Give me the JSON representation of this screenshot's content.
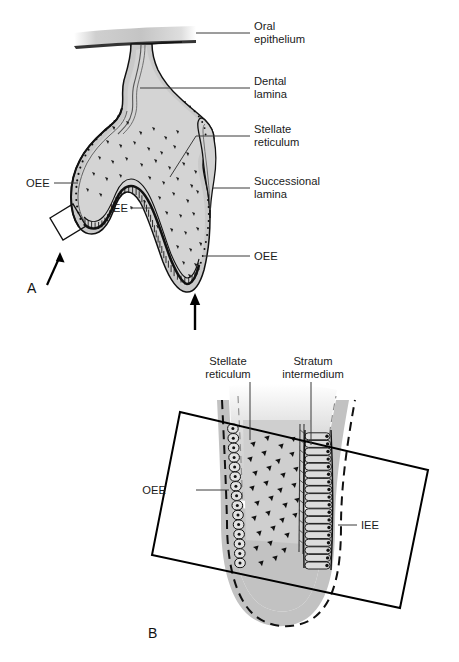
{
  "figure": {
    "panels": [
      {
        "id": "A",
        "letter": "A",
        "labels": [
          {
            "key": "oral_epithelium",
            "text_line1": "Oral",
            "text_line2": "epithelium"
          },
          {
            "key": "dental_lamina",
            "text_line1": "Dental",
            "text_line2": "lamina"
          },
          {
            "key": "stellate_reticulum",
            "text_line1": "Stellate",
            "text_line2": "reticulum"
          },
          {
            "key": "successional_lamina",
            "text_line1": "Successional",
            "text_line2": "lamina"
          },
          {
            "key": "oee_right",
            "text_line1": "OEE",
            "text_line2": ""
          },
          {
            "key": "oee_left",
            "text_line1": "OEE",
            "text_line2": ""
          },
          {
            "key": "iee",
            "text_line1": "IEE",
            "text_line2": ""
          }
        ]
      },
      {
        "id": "B",
        "letter": "B",
        "labels": [
          {
            "key": "stellate_reticulum",
            "text_line1": "Stellate",
            "text_line2": "reticulum"
          },
          {
            "key": "stratum_intermedium",
            "text_line1": "Stratum",
            "text_line2": "intermedium"
          },
          {
            "key": "oee",
            "text_line1": "OEE",
            "text_line2": ""
          },
          {
            "key": "iee",
            "text_line1": "IEE",
            "text_line2": ""
          }
        ]
      }
    ]
  },
  "panel_a": {
    "letter": "A",
    "label_oral_epithelium_l1": "Oral",
    "label_oral_epithelium_l2": "epithelium",
    "label_dental_lamina_l1": "Dental",
    "label_dental_lamina_l2": "lamina",
    "label_stellate_reticulum_l1": "Stellate",
    "label_stellate_reticulum_l2": "reticulum",
    "label_successional_lamina_l1": "Successional",
    "label_successional_lamina_l2": "lamina",
    "label_oee_right": "OEE",
    "label_oee_left": "OEE",
    "label_iee": "IEE"
  },
  "panel_b": {
    "letter": "B",
    "label_stellate_reticulum_l1": "Stellate",
    "label_stellate_reticulum_l2": "reticulum",
    "label_stratum_intermedium_l1": "Stratum",
    "label_stratum_intermedium_l2": "intermedium",
    "label_oee": "OEE",
    "label_iee": "IEE"
  },
  "colors": {
    "background": "#ffffff",
    "outline": "#000000",
    "tissue_fill": "#c9c9c9",
    "tissue_fill_light": "#d6d6d6",
    "epithelium_band": "#b5b5b5",
    "cell_nucleus": "#111111",
    "leader_line": "#3b3b3b",
    "text": "#1a1a1a",
    "oral_epithelium_gradient_start": "#b0b0b0",
    "oral_epithelium_gradient_end": "#ffffff"
  },
  "icons": {
    "arrow_a": "up-arrow-icon",
    "arrow_cervical": "up-arrow-icon",
    "magnifier_box_a": "detail-box-icon",
    "magnifier_box_b": "detail-box-icon"
  }
}
